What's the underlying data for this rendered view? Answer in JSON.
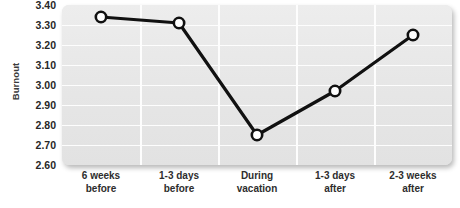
{
  "chart_data": {
    "type": "line",
    "title": "",
    "xlabel": "",
    "ylabel": "Burnout",
    "categories": [
      "6 weeks before",
      "1-3 days before",
      "During vacation",
      "1-3 days after",
      "2-3 weeks after"
    ],
    "category_lines": [
      [
        "6 weeks",
        "before"
      ],
      [
        "1-3 days",
        "before"
      ],
      [
        "During",
        "vacation"
      ],
      [
        "1-3 days",
        "after"
      ],
      [
        "2-3 weeks",
        "after"
      ]
    ],
    "values": [
      3.34,
      3.31,
      2.75,
      2.97,
      3.25
    ],
    "ylim": [
      2.6,
      3.4
    ],
    "ytick_labels": [
      "3.40",
      "3.30",
      "3.20",
      "3.10",
      "3.00",
      "2.90",
      "2.80",
      "2.70",
      "2.60"
    ],
    "ytick_values": [
      3.4,
      3.3,
      3.2,
      3.1,
      3.0,
      2.9,
      2.8,
      2.7,
      2.6
    ],
    "grid": true,
    "legend": "none",
    "series": [
      {
        "name": "Burnout",
        "values": [
          3.34,
          3.31,
          2.75,
          2.97,
          3.25
        ],
        "line_color": "#111111",
        "marker": "circle-open",
        "marker_face_color": "#ffffff",
        "marker_edge_color": "#111111"
      }
    ],
    "colors": {
      "panel_background": "#e9e9e9",
      "gridline": "#fdfdfd",
      "line": "#111111",
      "marker_fill": "#ffffff",
      "tick_text": "#272727",
      "axis_label_text": "#3b3b3b"
    }
  }
}
